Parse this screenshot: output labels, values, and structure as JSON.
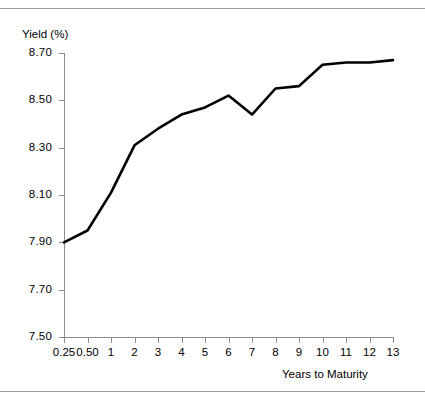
{
  "chart_data": {
    "type": "line",
    "title": "",
    "xlabel": "Years to Maturity",
    "ylabel": "Yield (%)",
    "categories": [
      "0.25",
      "0.50",
      "1",
      "2",
      "3",
      "4",
      "5",
      "6",
      "7",
      "8",
      "9",
      "10",
      "11",
      "12",
      "13"
    ],
    "values": [
      7.9,
      7.95,
      8.11,
      8.31,
      8.38,
      8.44,
      8.47,
      8.52,
      8.44,
      8.55,
      8.56,
      8.65,
      8.66,
      8.66,
      8.67
    ],
    "series": [
      {
        "name": "Yield curve",
        "values": [
          7.9,
          7.95,
          8.11,
          8.31,
          8.38,
          8.44,
          8.47,
          8.52,
          8.44,
          8.55,
          8.56,
          8.65,
          8.66,
          8.66,
          8.67
        ]
      }
    ],
    "ylim": [
      7.5,
      8.7
    ],
    "ytick_labels": [
      "8.70",
      "8.50",
      "8.30",
      "8.10",
      "7.90",
      "7.70",
      "7.50"
    ],
    "ytick_values": [
      8.7,
      8.5,
      8.3,
      8.1,
      7.9,
      7.7,
      7.5
    ],
    "ystep": 0.2,
    "grid": false,
    "legend": "none",
    "line_color": "#000000",
    "axis_color": "#8d8d8d",
    "background": "#ffffff"
  }
}
